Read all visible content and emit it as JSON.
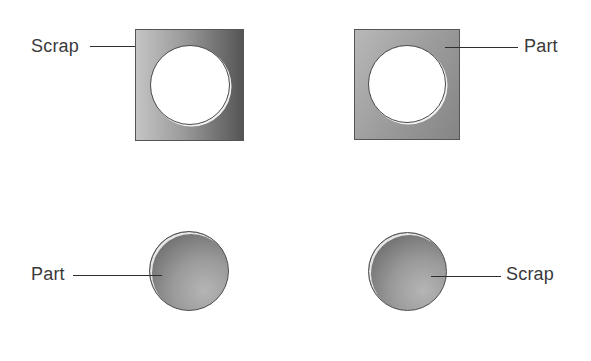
{
  "diagram": {
    "panels": [
      {
        "id": "top-left",
        "shape": "square-with-hole",
        "label": "Scrap",
        "label_side": "left",
        "label_points_to": "square frame"
      },
      {
        "id": "top-right",
        "shape": "square-with-hole",
        "label": "Part",
        "label_side": "right",
        "label_points_to": "square frame"
      },
      {
        "id": "bottom-left",
        "shape": "disc",
        "label": "Part",
        "label_side": "left",
        "label_points_to": "disc"
      },
      {
        "id": "bottom-right",
        "shape": "disc",
        "label": "Scrap",
        "label_side": "right",
        "label_points_to": "disc"
      }
    ],
    "colors": {
      "label_text": "#3a3a3a",
      "leader_line": "#2e2e2e",
      "background": "#ffffff",
      "metal_light": "#c4c4c4",
      "metal_dark": "#555555"
    }
  }
}
